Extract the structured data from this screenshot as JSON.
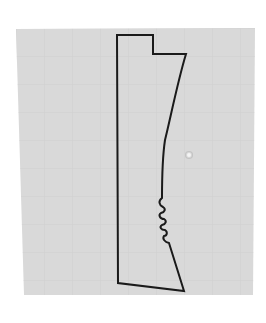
{
  "diagram": {
    "type": "technical-profile-outline",
    "colors": {
      "page_background": "#ffffff",
      "panel_background": "#d9d9d9",
      "grid_line": "#d0d0d0",
      "outline_stroke": "#1a1a1a",
      "marker_fill": "#f4f4f4",
      "marker_ring": "#c4c4c4"
    },
    "features": [
      {
        "name": "stepped-notch",
        "label": "top-right step"
      },
      {
        "name": "concave-edge",
        "label": "curved right edge"
      },
      {
        "name": "wavy-section",
        "label": "serrated section",
        "bump_count": 4
      },
      {
        "name": "reference-point",
        "label": "small circular marker"
      }
    ]
  }
}
